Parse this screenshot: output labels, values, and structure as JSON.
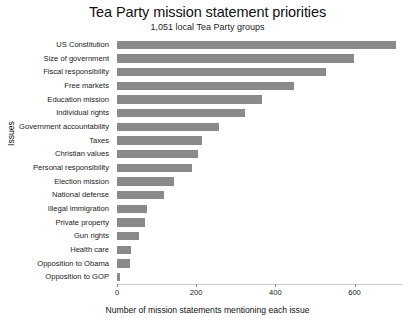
{
  "chart_data": {
    "type": "bar",
    "orientation": "horizontal",
    "title": "Tea Party mission statement priorities",
    "subtitle": "1,051 local Tea Party groups",
    "xlabel": "Number of mission statements mentioning each issue",
    "ylabel": "Issues",
    "xlim": [
      0,
      720
    ],
    "xticks": [
      0,
      200,
      400,
      600
    ],
    "xtick_labels": [
      "0",
      "200",
      "400",
      "600"
    ],
    "grid": false,
    "legend": false,
    "bar_color": "#8a8a8a",
    "background_color": "#ffffff",
    "categories": [
      "US Constitution",
      "Size of government",
      "Fiscal responsibility",
      "Free markets",
      "Education mission",
      "Individual rights",
      "Government accountability",
      "Taxes",
      "Christian values",
      "Personal responsibility",
      "Election mission",
      "National defense",
      "Illegal immigration",
      "Private property",
      "Gun rights",
      "Health care",
      "Opposition to Obama",
      "Opposition to GOP"
    ],
    "values": [
      705,
      598,
      527,
      448,
      366,
      323,
      257,
      215,
      205,
      190,
      145,
      118,
      76,
      70,
      55,
      36,
      33,
      8
    ]
  }
}
